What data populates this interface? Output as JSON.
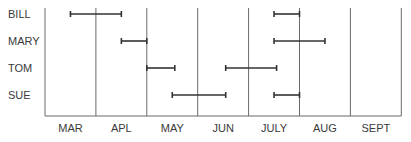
{
  "chart_data": {
    "type": "gantt",
    "title": "",
    "xlabel": "",
    "ylabel": "",
    "categories": [
      "MAR",
      "APL",
      "MAY",
      "JUN",
      "JULY",
      "AUG",
      "SEPT"
    ],
    "rows": [
      "BILL",
      "MARY",
      "TOM",
      "SUE"
    ],
    "series": [
      {
        "name": "BILL",
        "intervals": [
          [
            0.5,
            1.5
          ],
          [
            4.5,
            5.0
          ]
        ]
      },
      {
        "name": "MARY",
        "intervals": [
          [
            1.5,
            2.0
          ],
          [
            4.5,
            5.5
          ]
        ]
      },
      {
        "name": "TOM",
        "intervals": [
          [
            2.0,
            2.55
          ],
          [
            3.55,
            4.55
          ]
        ]
      },
      {
        "name": "SUE",
        "intervals": [
          [
            2.5,
            3.55
          ],
          [
            4.5,
            5.0
          ]
        ]
      }
    ],
    "x_unit": "month index from start of MAR (0) to end of SEPT (7)",
    "xlim": [
      0,
      7
    ],
    "grid": "vertical lines at month boundaries",
    "legend": "none"
  },
  "colors": {
    "bar": "#333333",
    "grid": "#6a6a6a",
    "text": "#3a3a3a"
  }
}
